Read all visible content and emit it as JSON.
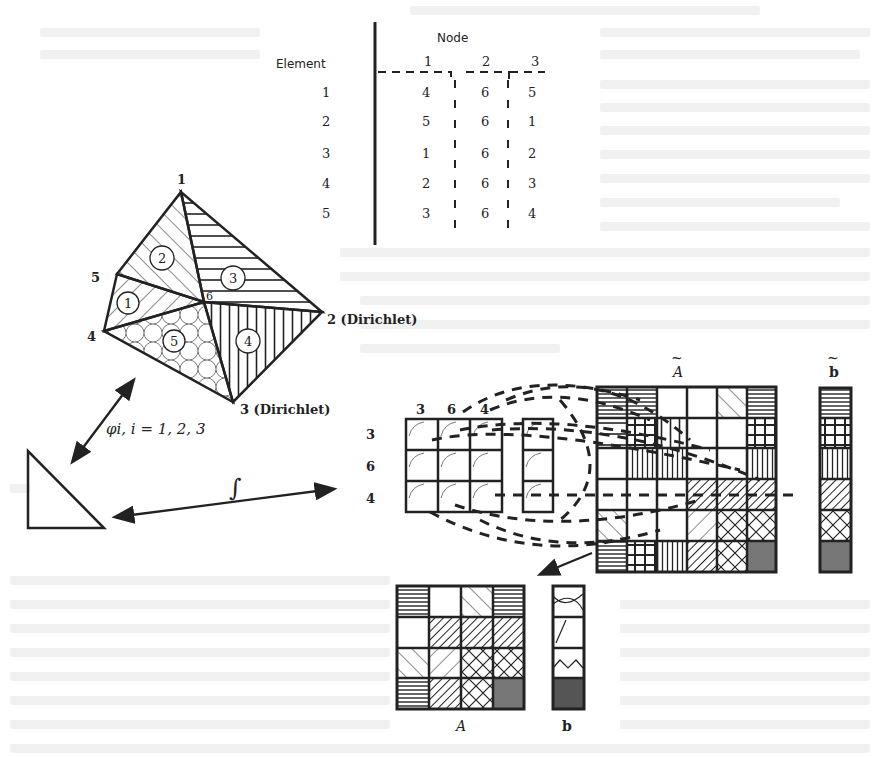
{
  "figure": {
    "table": {
      "row_header": "Element",
      "column_group_header": "Node",
      "columns": [
        "1",
        "2",
        "3"
      ],
      "rows": [
        {
          "element": "1",
          "nodes": [
            "4",
            "6",
            "5"
          ]
        },
        {
          "element": "2",
          "nodes": [
            "5",
            "6",
            "1"
          ]
        },
        {
          "element": "3",
          "nodes": [
            "1",
            "6",
            "2"
          ]
        },
        {
          "element": "4",
          "nodes": [
            "2",
            "6",
            "3"
          ]
        },
        {
          "element": "5",
          "nodes": [
            "3",
            "6",
            "4"
          ]
        }
      ]
    },
    "mesh": {
      "vertices": [
        {
          "id": "1",
          "label": "1",
          "x": 181,
          "y": 192
        },
        {
          "id": "2",
          "label": "2 (Dirichlet)",
          "x": 322,
          "y": 312
        },
        {
          "id": "3",
          "label": "3 (Dirichlet)",
          "x": 233,
          "y": 402
        },
        {
          "id": "4",
          "label": "4",
          "x": 104,
          "y": 331
        },
        {
          "id": "5",
          "label": "5",
          "x": 117,
          "y": 274
        },
        {
          "id": "6",
          "label": "6",
          "x": 204,
          "y": 302
        }
      ],
      "elements": [
        {
          "id": "1",
          "label": "1",
          "pattern": "diagonal-back"
        },
        {
          "id": "2",
          "label": "2",
          "pattern": "diagonal-fwd"
        },
        {
          "id": "3",
          "label": "3",
          "pattern": "horizontal"
        },
        {
          "id": "4",
          "label": "4",
          "pattern": "vertical"
        },
        {
          "id": "5",
          "label": "5",
          "pattern": "arcs"
        }
      ]
    },
    "reference_mapping_label": "φi, i = 1, 2, 3",
    "integral_label": "∫",
    "local_matrix": {
      "col_labels": [
        "3",
        "6",
        "4"
      ],
      "row_labels": [
        "3",
        "6",
        "4"
      ]
    },
    "global_matrix_label": "A",
    "global_vector_label": "b",
    "reduced_matrix_label": "A",
    "reduced_vector_label": "b"
  }
}
